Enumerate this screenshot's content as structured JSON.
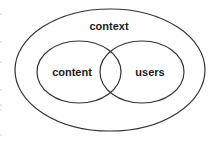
{
  "diagram": {
    "type": "venn",
    "outer": {
      "label": "context"
    },
    "sets": [
      {
        "label": "content"
      },
      {
        "label": "users"
      }
    ],
    "colors": {
      "stroke": "#333333",
      "text": "#1a1a1a",
      "background": "#ffffff"
    }
  }
}
